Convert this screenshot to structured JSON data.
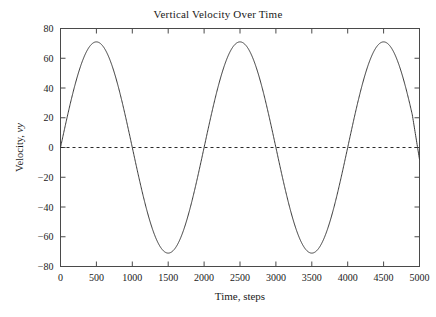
{
  "chart_data": {
    "type": "line",
    "title": "Vertical Velocity Over Time",
    "xlabel_full": "Time, steps",
    "xlabel_name": "Time",
    "xlabel_unit": "steps",
    "ylabel_full": "Velocity, vy",
    "ylabel_name": "Velocity",
    "ylabel_symbol": "vy",
    "xlim": [
      0,
      5000
    ],
    "ylim": [
      -80,
      80
    ],
    "xticks": [
      0,
      500,
      1000,
      1500,
      2000,
      2500,
      3000,
      3500,
      4000,
      4500,
      5000
    ],
    "yticks": [
      80,
      60,
      40,
      20,
      0,
      -20,
      -40,
      -60,
      -80
    ],
    "xtick_labels": [
      "0",
      "500",
      "1000",
      "1500",
      "2000",
      "2500",
      "3000",
      "3500",
      "4000",
      "4500",
      "5000"
    ],
    "ytick_labels": [
      "80",
      "60",
      "40",
      "20",
      "0",
      "−20",
      "−40",
      "−60",
      "−80"
    ],
    "grid": false,
    "legend": null,
    "line_color": "#3a3a3a",
    "reference_line": {
      "name": "zero-line",
      "y": 0,
      "style": "dashed",
      "color": "#2b2b2b"
    },
    "series": [
      {
        "name": "vertical-velocity",
        "amplitude": 71,
        "period": 2000,
        "phase_steps": 0,
        "baseline": 0,
        "start_value": 2,
        "end_value": -8,
        "peaks_x": [
          500,
          2500,
          4500
        ],
        "peaks_y": [
          71,
          70.5,
          70
        ],
        "troughs_x": [
          1500,
          3500
        ],
        "troughs_y": [
          -71.5,
          -71
        ],
        "zero_crossings_x": [
          1000,
          2000,
          3000,
          4000,
          5000
        ],
        "x": [
          0,
          100,
          200,
          300,
          400,
          500,
          600,
          700,
          800,
          900,
          1000,
          1100,
          1200,
          1300,
          1400,
          1500,
          1600,
          1700,
          1800,
          1900,
          2000,
          2100,
          2200,
          2300,
          2400,
          2500,
          2600,
          2700,
          2800,
          2900,
          3000,
          3100,
          3200,
          3300,
          3400,
          3500,
          3600,
          3700,
          3800,
          3900,
          4000,
          4100,
          4200,
          4300,
          4400,
          4500,
          4600,
          4700,
          4800,
          4900,
          5000
        ],
        "values": [
          2.0,
          23.9,
          43.7,
          59.1,
          68.6,
          71.4,
          67.4,
          57.0,
          41.3,
          21.9,
          0.7,
          -20.5,
          -39.9,
          -55.7,
          -66.2,
          -70.3,
          -67.7,
          -58.6,
          -43.9,
          -25.1,
          -3.9,
          17.5,
          37.3,
          53.7,
          65.1,
          70.5,
          69.5,
          62.3,
          49.2,
          31.7,
          11.4,
          -9.8,
          -30.1,
          -48.0,
          -61.7,
          -70.0,
          -72.0,
          -67.6,
          -57.2,
          -41.8,
          -22.5,
          -0.9,
          21.0,
          41.2,
          57.8,
          69.4,
          74.0,
          71.3,
          61.6,
          45.8,
          -8.0
        ]
      }
    ]
  },
  "axes": {
    "frame_color": "#4a4a4a",
    "tick_direction": "in"
  }
}
